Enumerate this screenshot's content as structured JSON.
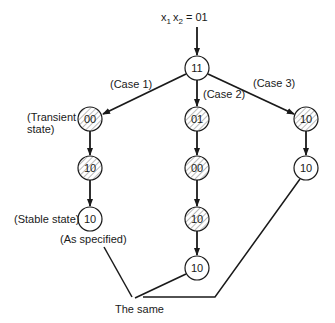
{
  "diagram": {
    "input_label_prefix": "x",
    "input_sub1": "1",
    "input_mid": "x",
    "input_sub2": "2",
    "input_value": " = 01",
    "root": {
      "id": "root",
      "label": "11",
      "hatched": false
    },
    "cases": [
      {
        "label": "(Case 1)"
      },
      {
        "label": "(Case 2)"
      },
      {
        "label": "(Case 3)"
      }
    ],
    "columns": [
      {
        "nodes": [
          {
            "label": "00",
            "hatched": true
          },
          {
            "label": "10",
            "hatched": true
          },
          {
            "label": "10",
            "hatched": false
          }
        ]
      },
      {
        "nodes": [
          {
            "label": "01",
            "hatched": true
          },
          {
            "label": "00",
            "hatched": true
          },
          {
            "label": "10",
            "hatched": true
          },
          {
            "label": "10",
            "hatched": false
          }
        ]
      },
      {
        "nodes": [
          {
            "label": "10",
            "hatched": true
          },
          {
            "label": "10",
            "hatched": false
          }
        ]
      }
    ],
    "annotations": {
      "transient_line1": "(Transient",
      "transient_line2": "state)",
      "stable": "(Stable state)",
      "as_specified": "(As specified)",
      "the_same": "The same"
    },
    "colors": {
      "ink": "#1a1a1a",
      "background": "#ffffff"
    }
  }
}
